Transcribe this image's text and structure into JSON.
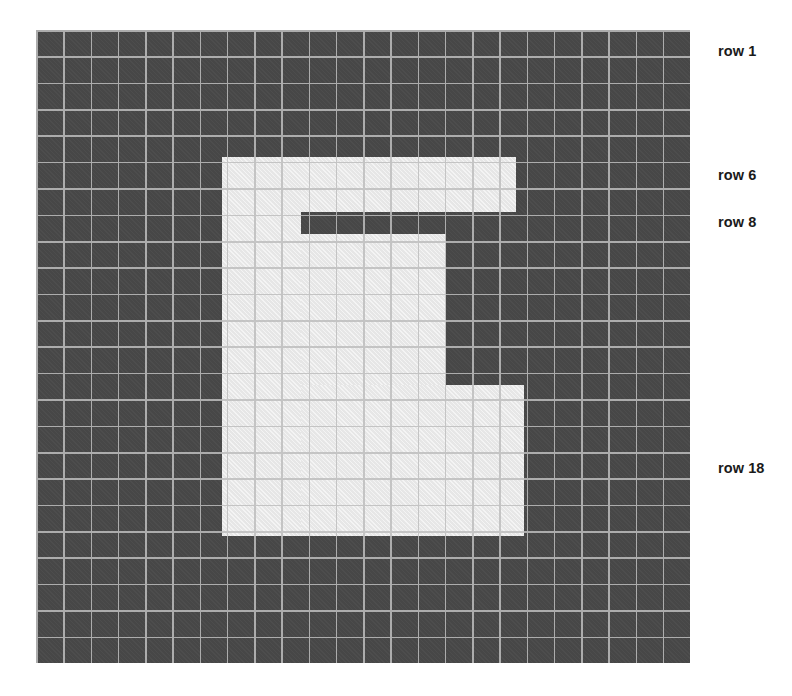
{
  "figure": {
    "kind": "pixel-grid-letterform",
    "background_color": "#ffffff",
    "grid": {
      "cell_color": "#474747",
      "line_color": "#bebebe",
      "columns": 24,
      "rows": 24,
      "cell_width_px": 27.25,
      "cell_height_px": 26.375,
      "origin_x_px": 36,
      "origin_y_px": 30,
      "width_px": 654,
      "height_px": 633
    },
    "glyph": {
      "character": "E",
      "fill_color": "#e6e6e6",
      "blocks": [
        {
          "name": "stem",
          "left": 186,
          "top": 127,
          "width": 79,
          "height": 379
        },
        {
          "name": "top-arm",
          "left": 265,
          "top": 127,
          "width": 215,
          "height": 55
        },
        {
          "name": "middle-arm",
          "left": 265,
          "top": 204,
          "width": 145,
          "height": 151
        },
        {
          "name": "bottom-arm",
          "left": 265,
          "top": 355,
          "width": 223,
          "height": 151
        }
      ]
    },
    "row_labels": [
      {
        "id": "row-1",
        "text": "row 1",
        "top_px": 44
      },
      {
        "id": "row-6",
        "text": "row 6",
        "top_px": 168
      },
      {
        "id": "row-8",
        "text": "row 8",
        "top_px": 215
      },
      {
        "id": "row-18",
        "text": "row 18",
        "top_px": 461
      }
    ]
  }
}
